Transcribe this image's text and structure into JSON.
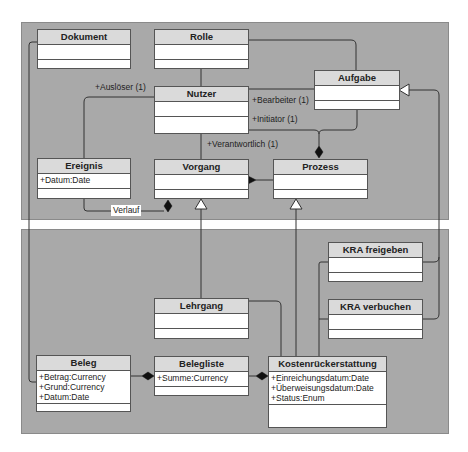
{
  "diagram": {
    "type": "UML class diagram",
    "panels": [
      "top-package",
      "bottom-package"
    ],
    "classes": {
      "dokument": {
        "name": "Dokument",
        "attributes": []
      },
      "rolle": {
        "name": "Rolle",
        "attributes": []
      },
      "nutzer": {
        "name": "Nutzer",
        "attributes": []
      },
      "aufgabe": {
        "name": "Aufgabe",
        "attributes": []
      },
      "ereignis": {
        "name": "Ereignis",
        "attributes": [
          "+Datum:Date"
        ]
      },
      "vorgang": {
        "name": "Vorgang",
        "attributes": []
      },
      "prozess": {
        "name": "Prozess",
        "attributes": []
      },
      "kra_freigeben": {
        "name": "KRA freigeben",
        "attributes": []
      },
      "kra_verbuchen": {
        "name": "KRA verbuchen",
        "attributes": []
      },
      "lehrgang": {
        "name": "Lehrgang",
        "attributes": []
      },
      "beleg": {
        "name": "Beleg",
        "attributes": [
          "+Betrag:Currency",
          "+Grund:Currency",
          "+Datum:Date"
        ]
      },
      "belegliste": {
        "name": "Belegliste",
        "attributes": [
          "+Summe:Currency"
        ]
      },
      "kostenrueckerstattung": {
        "name": "Kostenrückerstattung",
        "attributes": [
          "+Einreichungsdatum:Date",
          "+Überweisungsdatum:Date",
          "+Status:Enum"
        ]
      }
    },
    "labels": {
      "ausloeser": "+Auslöser (1)",
      "bearbeiter": "+Bearbeiter (1)",
      "initiator": "+Initiator (1)",
      "verantwortlich": "+Verantwortlich (1)",
      "verlauf": "Verlauf"
    },
    "relations": [
      {
        "from": "Rolle",
        "to": "Nutzer",
        "kind": "association"
      },
      {
        "from": "Rolle",
        "to": "Aufgabe",
        "kind": "association"
      },
      {
        "from": "Nutzer",
        "to": "Ereignis",
        "kind": "association",
        "label": "+Auslöser (1)"
      },
      {
        "from": "Nutzer",
        "to": "Aufgabe",
        "kind": "association",
        "label": "+Bearbeiter (1)"
      },
      {
        "from": "Nutzer",
        "to": "Prozess",
        "kind": "composition",
        "label": "+Initiator (1)"
      },
      {
        "from": "Aufgabe",
        "to": "Prozess",
        "kind": "composition"
      },
      {
        "from": "Nutzer",
        "to": "Vorgang",
        "kind": "association",
        "label": "+Verantwortlich (1)"
      },
      {
        "from": "Prozess",
        "to": "Vorgang",
        "kind": "composition"
      },
      {
        "from": "Ereignis",
        "to": "Vorgang",
        "kind": "composition",
        "label": "Verlauf"
      },
      {
        "from": "Lehrgang",
        "to": "Vorgang",
        "kind": "generalization"
      },
      {
        "from": "Kostenrückerstattung",
        "to": "Prozess",
        "kind": "generalization"
      },
      {
        "from": "KRA freigeben",
        "to": "Aufgabe",
        "kind": "generalization"
      },
      {
        "from": "KRA verbuchen",
        "to": "Aufgabe",
        "kind": "generalization"
      },
      {
        "from": "Lehrgang",
        "to": "Kostenrückerstattung",
        "kind": "association"
      },
      {
        "from": "Beleg",
        "to": "Belegliste",
        "kind": "composition"
      },
      {
        "from": "Belegliste",
        "to": "Kostenrückerstattung",
        "kind": "composition"
      },
      {
        "from": "Dokument",
        "to": "Beleg",
        "kind": "association"
      }
    ]
  }
}
